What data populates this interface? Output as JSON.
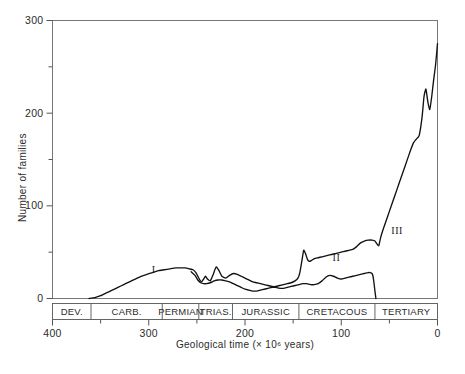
{
  "chart_data": {
    "type": "line",
    "title": "",
    "xlabel": "Geological time (× 10⁶ years)",
    "ylabel": "Number of families",
    "xlim": [
      400,
      0
    ],
    "ylim": [
      0,
      300
    ],
    "x_ticks": [
      400,
      300,
      200,
      100,
      0
    ],
    "x_ticklabels": [
      "400",
      "300",
      "200",
      "100",
      "0"
    ],
    "x_minor_ticks": [
      350,
      250,
      150,
      50
    ],
    "y_ticks": [
      0,
      100,
      200,
      300
    ],
    "y_ticklabels": [
      "0",
      "100",
      "200",
      "300"
    ],
    "y_minor_ticks": [
      50,
      150,
      250
    ],
    "grid": false,
    "legend": "none",
    "x_axis_reversed": true,
    "annotations": [
      {
        "label": "I",
        "x": 295,
        "y": 27
      },
      {
        "label": "II",
        "x": 105,
        "y": 40
      },
      {
        "label": "III",
        "x": 42,
        "y": 70
      }
    ],
    "period_bands": [
      {
        "label": "DEV.",
        "start": 408,
        "end": 360
      },
      {
        "label": "CARB.",
        "start": 360,
        "end": 286
      },
      {
        "label": "PERMIAN",
        "start": 286,
        "end": 248
      },
      {
        "label": "TRIAS.",
        "start": 248,
        "end": 213
      },
      {
        "label": "JURASSIC",
        "start": 213,
        "end": 144
      },
      {
        "label": "CRETACOUS",
        "start": 144,
        "end": 65
      },
      {
        "label": "TERTIARY",
        "start": 65,
        "end": -8
      }
    ],
    "series": [
      {
        "name": "upper-curve",
        "x": [
          362,
          356,
          350,
          344,
          338,
          332,
          326,
          320,
          314,
          308,
          302,
          296,
          290,
          284,
          278,
          272,
          266,
          262,
          258,
          254,
          251,
          249,
          247,
          245,
          243,
          241,
          239,
          236,
          233,
          230,
          227,
          224,
          220,
          216,
          212,
          208,
          204,
          200,
          196,
          192,
          188,
          184,
          180,
          176,
          172,
          168,
          164,
          160,
          156,
          152,
          148,
          145,
          143,
          141,
          139,
          137,
          135,
          133,
          131,
          128,
          124,
          120,
          116,
          112,
          108,
          104,
          100,
          96,
          92,
          88,
          84,
          80,
          76,
          72,
          68,
          65,
          63,
          61,
          59,
          56,
          52,
          48,
          44,
          40,
          36,
          32,
          28,
          25,
          22,
          19,
          16,
          14,
          12,
          10,
          8,
          6,
          4,
          2,
          0
        ],
        "y": [
          0,
          1,
          3,
          6,
          9,
          12,
          15,
          18,
          21,
          24,
          26,
          28,
          30,
          31,
          32,
          33,
          33,
          33,
          32,
          31,
          28,
          24,
          20,
          18,
          21,
          24,
          21,
          19,
          26,
          34,
          30,
          24,
          22,
          25,
          27,
          26,
          24,
          22,
          20,
          18,
          17,
          16,
          15,
          14,
          13,
          13,
          14,
          15,
          16,
          17,
          19,
          22,
          28,
          40,
          52,
          48,
          42,
          40,
          41,
          43,
          44,
          45,
          46,
          47,
          48,
          49,
          50,
          51,
          52,
          53,
          56,
          60,
          62,
          63,
          63,
          62,
          59,
          57,
          66,
          76,
          88,
          100,
          112,
          124,
          136,
          148,
          160,
          168,
          172,
          176,
          196,
          218,
          226,
          212,
          204,
          218,
          236,
          252,
          275
        ],
        "color": "#111111"
      },
      {
        "name": "lower-curve",
        "x": [
          256,
          252,
          249,
          246,
          243,
          240,
          236,
          232,
          228,
          224,
          220,
          216,
          212,
          208,
          204,
          200,
          196,
          192,
          188,
          184,
          180,
          176,
          172,
          168,
          164,
          160,
          156,
          152,
          148,
          144,
          140,
          136,
          132,
          128,
          124,
          120,
          116,
          112,
          108,
          104,
          100,
          96,
          92,
          88,
          84,
          80,
          76,
          72,
          70,
          68,
          67,
          66,
          65,
          64
        ],
        "y": [
          29,
          25,
          20,
          17,
          16,
          16,
          17,
          19,
          20,
          20,
          19,
          18,
          16,
          14,
          12,
          10,
          9,
          8,
          8,
          9,
          10,
          11,
          12,
          12,
          11,
          11,
          12,
          13,
          14,
          15,
          16,
          16,
          15,
          15,
          16,
          19,
          23,
          25,
          24,
          22,
          21,
          22,
          23,
          24,
          25,
          26,
          27,
          28,
          28,
          27,
          24,
          17,
          8,
          0
        ],
        "color": "#111111"
      }
    ]
  },
  "axis": {
    "x_title": "Geological time (× 10⁶ years)",
    "y_title": "Number of families"
  },
  "colors": {
    "curve": "#111111",
    "axis": "#555555",
    "frame": "#777777",
    "text": "#2b2b2b",
    "background": "#ffffff"
  }
}
